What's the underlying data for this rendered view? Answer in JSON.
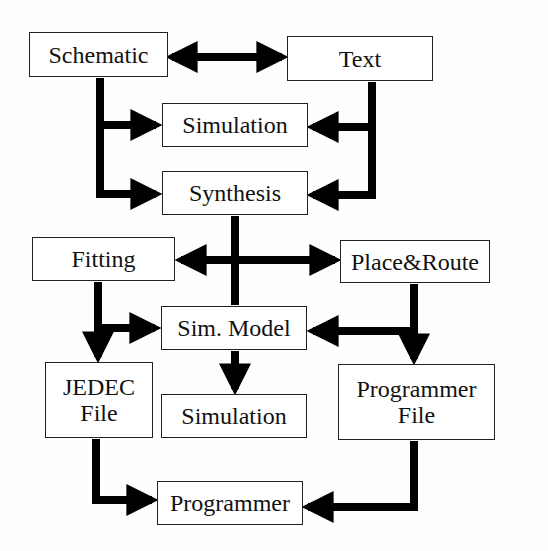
{
  "nodes": {
    "schematic": {
      "label": "Schematic"
    },
    "text": {
      "label": "Text"
    },
    "simulation_top": {
      "label": "Simulation"
    },
    "synthesis": {
      "label": "Synthesis"
    },
    "fitting": {
      "label": "Fitting"
    },
    "place_route": {
      "label": "Place&Route"
    },
    "sim_model": {
      "label": "Sim. Model"
    },
    "jedec_file": {
      "line1": "JEDEC",
      "line2": "File"
    },
    "simulation_bottom": {
      "label": "Simulation"
    },
    "programmer_file": {
      "line1": "Programmer",
      "line2": "File"
    },
    "programmer": {
      "label": "Programmer"
    }
  },
  "edges": [
    {
      "from": "schematic",
      "to": "text",
      "bidirectional": true
    },
    {
      "from": "schematic",
      "to": "simulation_top"
    },
    {
      "from": "schematic",
      "to": "synthesis"
    },
    {
      "from": "text",
      "to": "simulation_top"
    },
    {
      "from": "text",
      "to": "synthesis"
    },
    {
      "from": "synthesis",
      "to": "fitting"
    },
    {
      "from": "synthesis",
      "to": "place_route"
    },
    {
      "from": "synthesis",
      "to": "simulation_bottom"
    },
    {
      "from": "fitting",
      "to": "sim_model"
    },
    {
      "from": "fitting",
      "to": "jedec_file"
    },
    {
      "from": "place_route",
      "to": "sim_model"
    },
    {
      "from": "place_route",
      "to": "programmer_file"
    },
    {
      "from": "sim_model",
      "to": "simulation_bottom"
    },
    {
      "from": "jedec_file",
      "to": "programmer"
    },
    {
      "from": "programmer_file",
      "to": "programmer"
    }
  ],
  "colors": {
    "line": "#000000",
    "border": "#222222",
    "background": "#fefefe"
  }
}
